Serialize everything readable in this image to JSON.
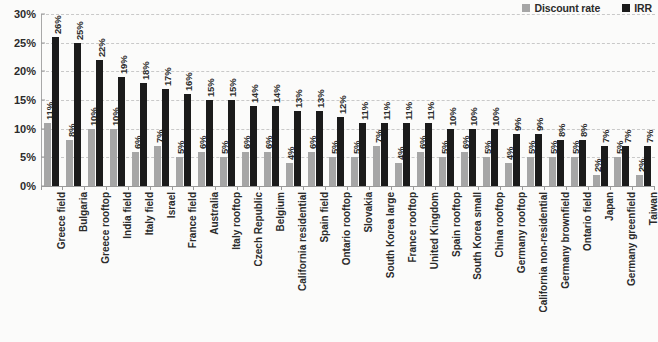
{
  "legend": {
    "position": "top-right",
    "items": [
      {
        "label": "Discount rate",
        "color": "#a6a6a6",
        "icon": "square-swatch-icon"
      },
      {
        "label": "IRR",
        "color": "#1b1b1b",
        "icon": "square-swatch-icon"
      }
    ]
  },
  "axes": {
    "y_ticks": [
      "0%",
      "5%",
      "10%",
      "15%",
      "20%",
      "25%",
      "30%"
    ],
    "y_min": 0,
    "y_max": 30,
    "y_step": 5
  },
  "chart_data": {
    "type": "bar",
    "title": "",
    "subtitle": "",
    "xlabel": "",
    "ylabel": "",
    "ylim": [
      0,
      30
    ],
    "ytick_values": [
      0,
      5,
      10,
      15,
      20,
      25,
      30
    ],
    "ytick_labels": [
      "0%",
      "5%",
      "10%",
      "15%",
      "20%",
      "25%",
      "30%"
    ],
    "grid": true,
    "grid_style": "dashed-horizontal",
    "legend_position": "top-right",
    "value_label_suffix": "%",
    "categories": [
      "Greece field",
      "Bulgaria",
      "Greece rooftop",
      "India field",
      "Italy field",
      "Israel",
      "France field",
      "Australia",
      "Italy rooftop",
      "Czech Republic",
      "Belgium",
      "California residential",
      "Spain field",
      "Ontario rooftop",
      "Slovakia",
      "South Korea large",
      "France rooftop",
      "United Kingdom",
      "Spain rooftop",
      "South Korea small",
      "China rooftop",
      "Germany rooftop",
      "California non-residential",
      "Germany brownfield",
      "Ontario field",
      "Japan",
      "Germany greenfield",
      "Taiwan"
    ],
    "series": [
      {
        "name": "Discount rate",
        "color": "#a6a6a6",
        "values": [
          11,
          8,
          10,
          10,
          6,
          7,
          5,
          6,
          5,
          6,
          6,
          4,
          6,
          5,
          5,
          7,
          4,
          6,
          5,
          6,
          5,
          4,
          5,
          5,
          5,
          2,
          5,
          2
        ],
        "labels": [
          "11%",
          "8%",
          "10%",
          "10%",
          "6%",
          "7%",
          "5%",
          "6%",
          "5%",
          "6%",
          "6%",
          "4%",
          "6%",
          "5%",
          "5%",
          "7%",
          "4%",
          "6%",
          "5%",
          "6%",
          "5%",
          "4%",
          "5%",
          "5%",
          "5%",
          "2%",
          "5%",
          "2%"
        ]
      },
      {
        "name": "IRR",
        "color": "#1b1b1b",
        "values": [
          26,
          25,
          22,
          19,
          18,
          17,
          16,
          15,
          15,
          14,
          14,
          13,
          13,
          12,
          11,
          11,
          11,
          11,
          10,
          10,
          10,
          9,
          9,
          8,
          8,
          7,
          7,
          7
        ],
        "labels": [
          "26%",
          "25%",
          "22%",
          "19%",
          "18%",
          "17%",
          "16%",
          "15%",
          "15%",
          "14%",
          "14%",
          "13%",
          "13%",
          "12%",
          "11%",
          "11%",
          "11%",
          "11%",
          "10%",
          "10%",
          "10%",
          "9%",
          "9%",
          "8%",
          "8%",
          "7%",
          "7%",
          "7%"
        ]
      }
    ]
  }
}
